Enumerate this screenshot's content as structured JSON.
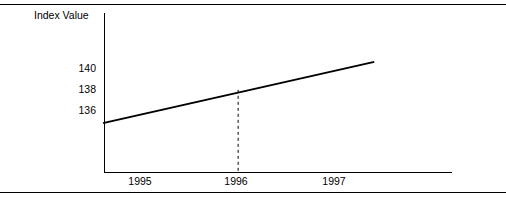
{
  "figure": {
    "top_rule": true,
    "bottom_rule": true,
    "background": "#ffffff",
    "line_color": "#000000"
  },
  "chart_data": {
    "type": "line",
    "title": "",
    "subtitle": "",
    "xlabel": "",
    "ylabel": "Index Value",
    "ylabel_position": "top-left",
    "grid": false,
    "legend": false,
    "legend_position": "none",
    "xlim": [
      1994.62,
      1998.2
    ],
    "ylim": [
      130.3,
      145.2
    ],
    "x_tick_labels": [
      "1995",
      "1996",
      "1997"
    ],
    "x_ticks": [
      1995,
      1996,
      1997
    ],
    "y_tick_labels": [
      "140",
      "138",
      "136"
    ],
    "y_ticks": [
      140,
      138,
      136
    ],
    "series": [
      {
        "name": "Index Value",
        "style": "solid",
        "color": "#000000",
        "x": [
          1994.62,
          1997.39
        ],
        "values": [
          134.9,
          140.6
        ]
      }
    ],
    "annotations": [
      {
        "type": "vertical-dashed-line",
        "name": "dropline-1996",
        "x": 1996,
        "y_from": 138.0,
        "y_to": 130.3,
        "color": "#000000",
        "dash": "3 3"
      }
    ]
  }
}
